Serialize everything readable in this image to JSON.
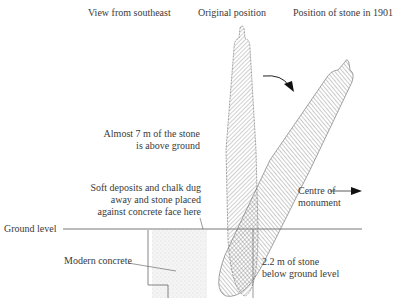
{
  "diagram": {
    "headers": {
      "view": "View from southeast",
      "original": "Original position",
      "position_1901": "Position of stone in 1901"
    },
    "labels": {
      "above_ground_line1": "Almost 7 m of the stone",
      "above_ground_line2": "is above ground",
      "soft_deposits_line1": "Soft deposits and chalk dug",
      "soft_deposits_line2": "away and stone placed",
      "soft_deposits_line3": "against concrete face here",
      "centre_line1": "Centre of",
      "centre_line2": "monument",
      "ground_level": "Ground level",
      "modern_concrete": "Modern concrete",
      "below_ground_line1": "2.2 m of stone",
      "below_ground_line2": "below ground level"
    },
    "colors": {
      "line": "#555555",
      "hatch": "#888888",
      "concrete_stipple": "#d8d8d8"
    }
  }
}
